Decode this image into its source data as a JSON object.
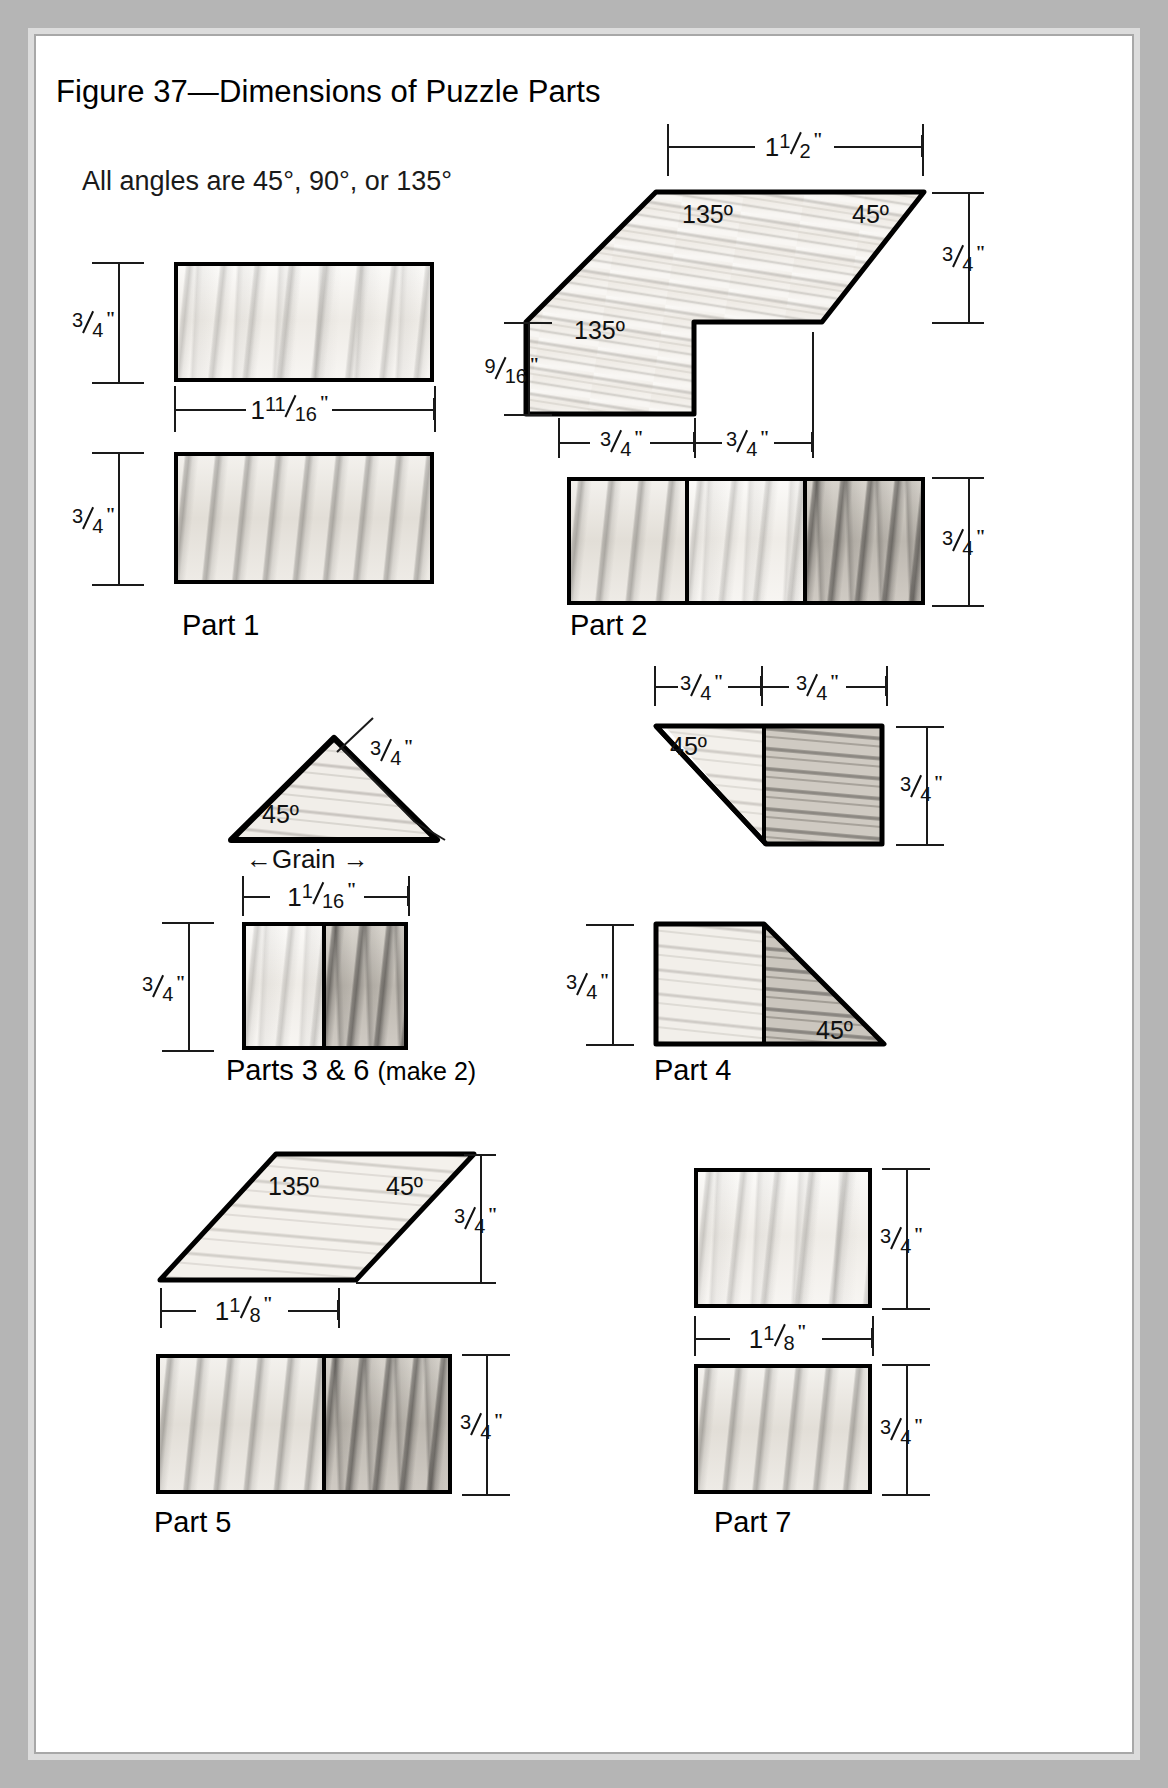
{
  "figure": {
    "title": "Figure 37—Dimensions of Puzzle Parts",
    "note": "All angles are 45°, 90°, or 135°"
  },
  "angles": {
    "a45": "45º",
    "a135": "135º"
  },
  "grain": {
    "label": "Grain",
    "arrow_left": "←",
    "arrow_right": "→"
  },
  "fractions": {
    "three_quarter": {
      "whole": "",
      "num": "3",
      "den": "4",
      "unit": "\""
    },
    "nine_sixteenth": {
      "whole": "",
      "num": "9",
      "den": "16",
      "unit": "\""
    },
    "one_half": {
      "whole": "1",
      "num": "1",
      "den": "2",
      "unit": "\""
    },
    "one_eleven_sixteenth": {
      "whole": "1",
      "num": "11",
      "den": "16",
      "unit": "\""
    },
    "one_one_sixteenth": {
      "whole": "1",
      "num": "1",
      "den": "16",
      "unit": "\""
    },
    "one_one_eighth": {
      "whole": "1",
      "num": "1",
      "den": "8",
      "unit": "\""
    }
  },
  "parts": {
    "part1": {
      "caption": "Part 1",
      "sub": ""
    },
    "part2": {
      "caption": "Part 2",
      "sub": ""
    },
    "part36": {
      "caption": "Parts 3 & 6 ",
      "sub": "(make 2)"
    },
    "part4": {
      "caption": "Part 4",
      "sub": ""
    },
    "part5": {
      "caption": "Part 5",
      "sub": ""
    },
    "part7": {
      "caption": "Part 7",
      "sub": ""
    }
  },
  "colors": {
    "page": "#ffffff",
    "border": "#b5b5b5",
    "frame": "#dcdcdc",
    "ink": "#000000"
  }
}
